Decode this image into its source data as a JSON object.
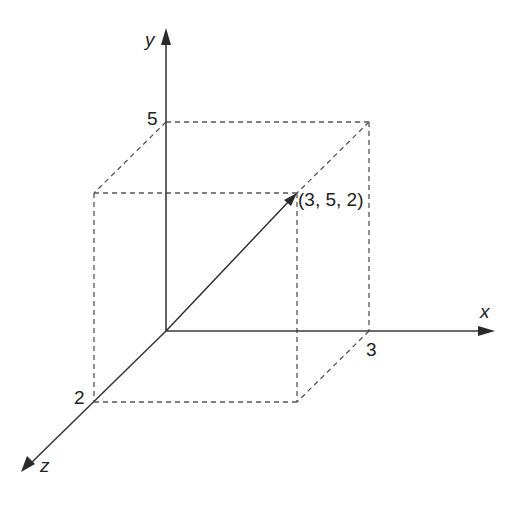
{
  "diagram": {
    "type": "3d-coordinate-vector",
    "axes": {
      "x": {
        "label": "x",
        "tick_value": "3"
      },
      "y": {
        "label": "y",
        "tick_value": "5"
      },
      "z": {
        "label": "z",
        "tick_value": "2"
      }
    },
    "point": {
      "coordinates": [
        3,
        5,
        2
      ],
      "label": "(3, 5, 2)"
    },
    "box": {
      "style": "dashed",
      "dimensions": {
        "x": 3,
        "y": 5,
        "z": 2
      }
    },
    "colors": {
      "axis": "#3a3a3a",
      "vector": "#2a2a2a",
      "dashed": "#555555",
      "text": "#222222",
      "background": "#ffffff"
    }
  }
}
